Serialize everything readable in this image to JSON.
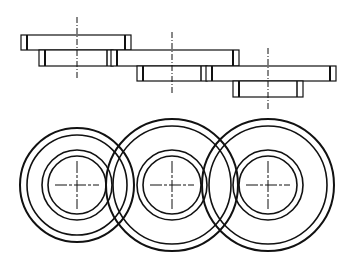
{
  "diagram": {
    "type": "technical-drawing",
    "colors": {
      "background": "#ffffff",
      "line": "#111111"
    },
    "elevation_view": {
      "parts": [
        {
          "name": "flange-1",
          "top_plate": {
            "x": 21,
            "y": 35,
            "w": 110,
            "h": 15
          },
          "boss": {
            "x": 39,
            "y": 50,
            "w": 74,
            "h": 16
          },
          "centerline_x": 77
        },
        {
          "name": "flange-2",
          "top_plate": {
            "x": 111,
            "y": 50,
            "w": 128,
            "h": 16
          },
          "boss": {
            "x": 137,
            "y": 66,
            "w": 70,
            "h": 15
          },
          "centerline_x": 172
        },
        {
          "name": "flange-3",
          "top_plate": {
            "x": 206,
            "y": 66,
            "w": 130,
            "h": 15
          },
          "boss": {
            "x": 233,
            "y": 81,
            "w": 70,
            "h": 16
          },
          "centerline_x": 268
        }
      ]
    },
    "plan_view": {
      "parts": [
        {
          "name": "flange-1-plan",
          "cx": 77,
          "cy": 185,
          "radii": [
            57,
            50,
            35,
            29
          ]
        },
        {
          "name": "flange-2-plan",
          "cx": 172,
          "cy": 185,
          "radii": [
            66,
            59,
            35,
            29
          ]
        },
        {
          "name": "flange-3-plan",
          "cx": 268,
          "cy": 185,
          "radii": [
            66,
            59,
            35,
            29
          ]
        }
      ]
    }
  }
}
